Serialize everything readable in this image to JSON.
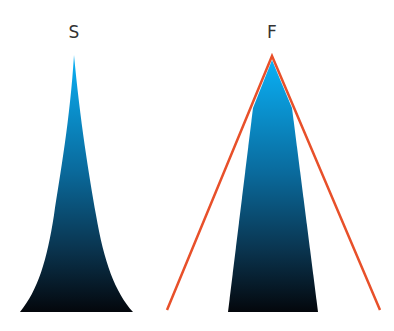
{
  "diagram": {
    "left": {
      "label": "S"
    },
    "right": {
      "label": "F"
    },
    "colors": {
      "gradient_top": "#0aa8ee",
      "gradient_mid": "#0a5a86",
      "gradient_bottom": "#05090f",
      "outline": "#e8502a",
      "label": "#333333"
    }
  }
}
